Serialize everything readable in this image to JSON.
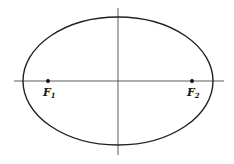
{
  "diagram": {
    "type": "ellipse-with-foci",
    "colors": {
      "stroke": "#222222",
      "background": "#ffffff"
    },
    "ellipse": {
      "cx": 118,
      "cy": 81,
      "rx": 95,
      "ry": 64
    },
    "axes": {
      "horizontal": {
        "x1": 14,
        "x2": 224,
        "y": 81
      },
      "vertical": {
        "x": 118,
        "y1": 8,
        "y2": 155
      }
    },
    "foci": [
      {
        "id": "F1",
        "letter": "F",
        "subscript": "1",
        "x": 48,
        "y": 81
      },
      {
        "id": "F2",
        "letter": "F",
        "subscript": "2",
        "x": 192,
        "y": 81
      }
    ]
  }
}
